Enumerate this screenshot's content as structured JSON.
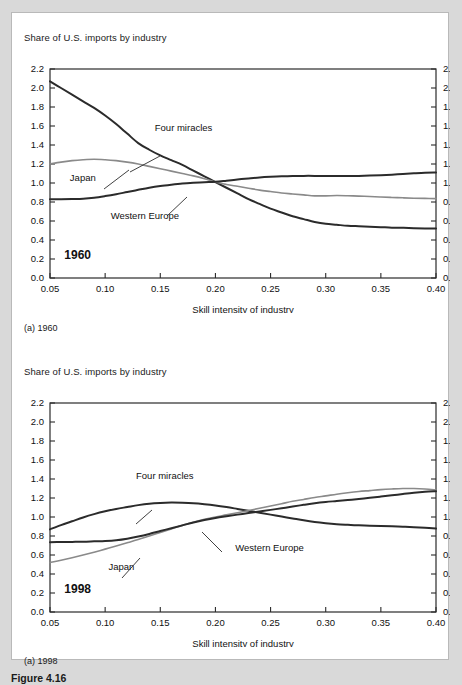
{
  "figure": {
    "number_label": "Figure 4.16",
    "background_color": "#d9d9d9",
    "panel_color": "#ffffff"
  },
  "panels": [
    {
      "id": "panel-1960",
      "title": "Share of U.S. imports by industry",
      "caption": "(a) 1960",
      "year_annotation": "1960"
    },
    {
      "id": "panel-1998",
      "title": "Share of U.S. imports by industry",
      "caption": "(a) 1998",
      "year_annotation": "1998"
    }
  ],
  "chart_data": [
    {
      "type": "line",
      "id": "chart-1960",
      "title": "Share of U.S. imports by industry",
      "subtitle": "1960",
      "caption": "(a) 1960",
      "xlabel": "Skill intensity of industry",
      "ylabel": "Share of U.S. imports by industry",
      "xlim": [
        0.05,
        0.4
      ],
      "ylim": [
        0.0,
        2.2
      ],
      "xticks": [
        "0.05",
        "0.10",
        "0.15",
        "0.20",
        "0.25",
        "0.30",
        "0.35",
        "0.40"
      ],
      "xtick_values": [
        0.05,
        0.1,
        0.15,
        0.2,
        0.25,
        0.3,
        0.35,
        0.4
      ],
      "yticks": [
        "0.0",
        "0.2",
        "0.4",
        "0.6",
        "0.8",
        "1.0",
        "1.2",
        "1.4",
        "1.6",
        "1.8",
        "2.0",
        "2.2"
      ],
      "ytick_values": [
        0.0,
        0.2,
        0.4,
        0.6,
        0.8,
        1.0,
        1.2,
        1.4,
        1.6,
        1.8,
        2.0,
        2.2
      ],
      "right_axis_yticks": [
        "0.0",
        "0.2",
        "0.4",
        "0.6",
        "0.8",
        "1.0",
        "1.2",
        "1.4",
        "1.6",
        "1.8",
        "2.0",
        "2.2"
      ],
      "grid": false,
      "legend": "inline-annotations",
      "x": [
        0.05,
        0.06,
        0.07,
        0.08,
        0.09,
        0.1,
        0.11,
        0.12,
        0.13,
        0.14,
        0.15,
        0.16,
        0.17,
        0.18,
        0.19,
        0.2,
        0.21,
        0.22,
        0.23,
        0.24,
        0.25,
        0.26,
        0.27,
        0.28,
        0.29,
        0.3,
        0.31,
        0.32,
        0.33,
        0.34,
        0.35,
        0.36,
        0.37,
        0.38,
        0.39,
        0.4
      ],
      "series": [
        {
          "name": "Four miracles",
          "color": "#2b2b2b",
          "width": 2.0,
          "values": [
            2.07,
            2.0,
            1.93,
            1.86,
            1.79,
            1.71,
            1.62,
            1.52,
            1.42,
            1.35,
            1.29,
            1.24,
            1.19,
            1.13,
            1.07,
            1.01,
            0.95,
            0.89,
            0.83,
            0.78,
            0.73,
            0.69,
            0.65,
            0.62,
            0.59,
            0.57,
            0.56,
            0.55,
            0.545,
            0.54,
            0.535,
            0.53,
            0.528,
            0.525,
            0.522,
            0.52
          ]
        },
        {
          "name": "Japan",
          "color": "#8a8a8a",
          "width": 1.6,
          "values": [
            1.2,
            1.22,
            1.235,
            1.245,
            1.25,
            1.245,
            1.235,
            1.22,
            1.2,
            1.175,
            1.15,
            1.125,
            1.1,
            1.075,
            1.045,
            1.01,
            0.985,
            0.965,
            0.945,
            0.925,
            0.91,
            0.895,
            0.885,
            0.875,
            0.865,
            0.865,
            0.868,
            0.866,
            0.862,
            0.858,
            0.853,
            0.848,
            0.844,
            0.84,
            0.838,
            0.836
          ]
        },
        {
          "name": "Western Europe",
          "color": "#2b2b2b",
          "width": 2.0,
          "values": [
            0.83,
            0.83,
            0.832,
            0.835,
            0.845,
            0.862,
            0.882,
            0.905,
            0.928,
            0.95,
            0.968,
            0.982,
            0.994,
            1.002,
            1.008,
            1.012,
            1.024,
            1.037,
            1.048,
            1.058,
            1.065,
            1.07,
            1.073,
            1.075,
            1.075,
            1.074,
            1.073,
            1.073,
            1.075,
            1.078,
            1.082,
            1.088,
            1.095,
            1.102,
            1.108,
            1.11
          ]
        }
      ],
      "annotations": [
        {
          "text": "Four miracles",
          "x": 0.145,
          "y": 1.545
        },
        {
          "text": "Japan",
          "x": 0.068,
          "y": 1.02
        },
        {
          "text": "Western Europe",
          "x": 0.105,
          "y": 0.625
        },
        {
          "text": "1960",
          "x": 0.063,
          "y": 0.205
        }
      ]
    },
    {
      "type": "line",
      "id": "chart-1998",
      "title": "Share of U.S. imports by industry",
      "subtitle": "1998",
      "caption": "(a) 1998",
      "xlabel": "Skill intensity of industry",
      "ylabel": "Share of U.S. imports by industry",
      "xlim": [
        0.05,
        0.4
      ],
      "ylim": [
        0.0,
        2.2
      ],
      "xticks": [
        "0.05",
        "0.10",
        "0.15",
        "0.20",
        "0.25",
        "0.30",
        "0.35",
        "0.40"
      ],
      "xtick_values": [
        0.05,
        0.1,
        0.15,
        0.2,
        0.25,
        0.3,
        0.35,
        0.4
      ],
      "yticks": [
        "0.0",
        "0.2",
        "0.4",
        "0.6",
        "0.8",
        "1.0",
        "1.2",
        "1.4",
        "1.6",
        "1.8",
        "2.0",
        "2.2"
      ],
      "ytick_values": [
        0.0,
        0.2,
        0.4,
        0.6,
        0.8,
        1.0,
        1.2,
        1.4,
        1.6,
        1.8,
        2.0,
        2.2
      ],
      "right_axis_yticks": [
        "0.0",
        "0.2",
        "0.4",
        "0.6",
        "0.8",
        "1.0",
        "1.2",
        "1.4",
        "1.6",
        "1.8",
        "2.0",
        "2.2"
      ],
      "grid": false,
      "legend": "inline-annotations",
      "x": [
        0.05,
        0.06,
        0.07,
        0.08,
        0.09,
        0.1,
        0.11,
        0.12,
        0.13,
        0.14,
        0.15,
        0.16,
        0.17,
        0.18,
        0.19,
        0.2,
        0.21,
        0.22,
        0.23,
        0.24,
        0.25,
        0.26,
        0.27,
        0.28,
        0.29,
        0.3,
        0.31,
        0.32,
        0.33,
        0.34,
        0.35,
        0.36,
        0.37,
        0.38,
        0.39,
        0.4
      ],
      "series": [
        {
          "name": "Four miracles",
          "color": "#2b2b2b",
          "width": 2.0,
          "values": [
            0.87,
            0.915,
            0.955,
            0.995,
            1.03,
            1.06,
            1.085,
            1.105,
            1.125,
            1.14,
            1.148,
            1.152,
            1.15,
            1.145,
            1.135,
            1.122,
            1.105,
            1.085,
            1.065,
            1.045,
            1.025,
            1.005,
            0.985,
            0.965,
            0.948,
            0.935,
            0.925,
            0.918,
            0.912,
            0.908,
            0.905,
            0.902,
            0.898,
            0.892,
            0.886,
            0.878
          ]
        },
        {
          "name": "Japan",
          "color": "#8a8a8a",
          "width": 1.6,
          "values": [
            0.52,
            0.545,
            0.572,
            0.6,
            0.63,
            0.662,
            0.695,
            0.728,
            0.762,
            0.8,
            0.838,
            0.875,
            0.912,
            0.945,
            0.975,
            1.0,
            1.022,
            1.045,
            1.068,
            1.092,
            1.115,
            1.14,
            1.165,
            1.185,
            1.205,
            1.222,
            1.24,
            1.255,
            1.268,
            1.278,
            1.288,
            1.295,
            1.3,
            1.3,
            1.295,
            1.285
          ]
        },
        {
          "name": "Western Europe",
          "color": "#2b2b2b",
          "width": 2.0,
          "values": [
            0.735,
            0.736,
            0.738,
            0.74,
            0.744,
            0.748,
            0.756,
            0.772,
            0.795,
            0.822,
            0.852,
            0.882,
            0.912,
            0.942,
            0.968,
            0.99,
            1.008,
            1.025,
            1.042,
            1.058,
            1.075,
            1.092,
            1.11,
            1.128,
            1.145,
            1.158,
            1.168,
            1.178,
            1.19,
            1.202,
            1.215,
            1.228,
            1.242,
            1.255,
            1.265,
            1.272
          ]
        }
      ],
      "annotations": [
        {
          "text": "Four miracles",
          "x": 0.128,
          "y": 1.405
        },
        {
          "text": "Western Europe",
          "x": 0.218,
          "y": 0.645
        },
        {
          "text": "Japan",
          "x": 0.103,
          "y": 0.44
        },
        {
          "text": "1998",
          "x": 0.063,
          "y": 0.205
        }
      ]
    }
  ]
}
